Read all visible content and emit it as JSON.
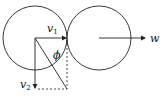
{
  "diagram": {
    "title": "",
    "labels": {
      "v1": "v",
      "v1_sub": "1",
      "v2": "v",
      "v2_sub": "2",
      "phi": "ϕ",
      "w": "w"
    },
    "circles": [
      {
        "name": "left-circle",
        "cx": 35,
        "cy": 38,
        "r": 32
      },
      {
        "name": "right-circle",
        "cx": 99,
        "cy": 38,
        "r": 32
      }
    ],
    "colors": {
      "stroke": "#222222",
      "background": "#ffffff"
    }
  }
}
